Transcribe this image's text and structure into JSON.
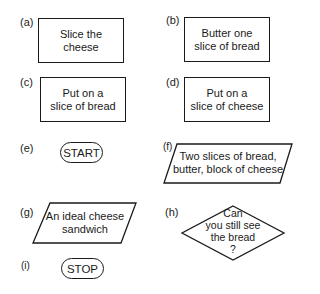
{
  "diagram": {
    "type": "flowchart-symbols",
    "items": [
      {
        "label": "(a)",
        "shape": "process-rectangle",
        "text_lines": [
          "Slice the",
          "cheese"
        ]
      },
      {
        "label": "(b)",
        "shape": "process-rectangle",
        "text_lines": [
          "Butter one",
          "slice of bread"
        ]
      },
      {
        "label": "(c)",
        "shape": "process-rectangle",
        "text_lines": [
          "Put on a",
          "slice of bread"
        ]
      },
      {
        "label": "(d)",
        "shape": "process-rectangle",
        "text_lines": [
          "Put on a",
          "slice of cheese"
        ]
      },
      {
        "label": "(e)",
        "shape": "terminator",
        "text_lines": [
          "START"
        ]
      },
      {
        "label": "(f)",
        "shape": "input-output-parallelogram",
        "text_lines": [
          "Two slices of bread,",
          "butter, block of cheese"
        ]
      },
      {
        "label": "(g)",
        "shape": "input-output-parallelogram",
        "text_lines": [
          "An ideal cheese",
          "sandwich"
        ]
      },
      {
        "label": "(h)",
        "shape": "decision-diamond",
        "text_lines": [
          "Can",
          "you still see",
          "the bread",
          "?"
        ]
      },
      {
        "label": "(i)",
        "shape": "terminator",
        "text_lines": [
          "STOP"
        ]
      }
    ],
    "colors": {
      "stroke": "#1a1a1a",
      "background": "#ffffff"
    }
  }
}
